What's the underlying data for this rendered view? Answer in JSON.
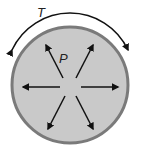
{
  "diagram": {
    "labels": {
      "tension": "T",
      "pressure": "P"
    },
    "colors": {
      "fill": "#c9c9c9",
      "rim": "#7a7a7a",
      "arrow": "#111111"
    }
  }
}
